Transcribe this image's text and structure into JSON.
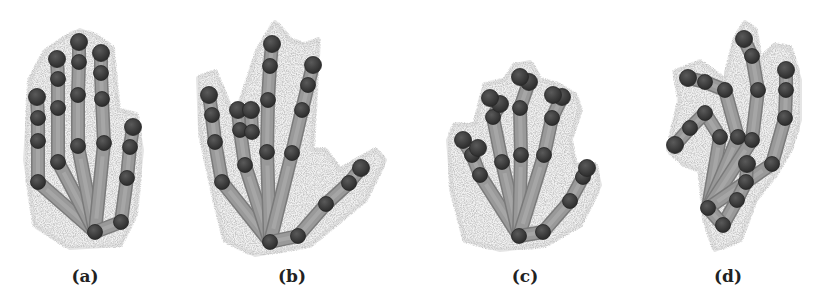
{
  "figure": {
    "background": "#ffffff",
    "colors": {
      "point_cloud": "#bdbdbd",
      "bone": "#999999",
      "bone_edge": "#7a7a7a",
      "joint": "#3c3c3c",
      "joint_band": "#585858"
    },
    "panels": [
      {
        "id": "a",
        "label": "(a)",
        "label_x": 85,
        "cloud": [
          [
            30,
            80
          ],
          [
            45,
            52
          ],
          [
            65,
            38
          ],
          [
            80,
            30
          ],
          [
            96,
            36
          ],
          [
            112,
            48
          ],
          [
            118,
            110
          ],
          [
            136,
            115
          ],
          [
            142,
            150
          ],
          [
            135,
            215
          ],
          [
            120,
            245
          ],
          [
            70,
            248
          ],
          [
            35,
            225
          ],
          [
            25,
            160
          ]
        ],
        "roots": [
          [
            95,
            232
          ],
          [
            121,
            222
          ]
        ],
        "fingers": [
          {
            "name": "pinky",
            "root": 0,
            "joints": [
              [
                38,
                182
              ],
              [
                38,
                141
              ],
              [
                38,
                118
              ],
              [
                37,
                97
              ]
            ]
          },
          {
            "name": "ring",
            "root": 0,
            "joints": [
              [
                58,
                162
              ],
              [
                58,
                108
              ],
              [
                58,
                79
              ],
              [
                57,
                59
              ]
            ]
          },
          {
            "name": "middle",
            "root": 0,
            "joints": [
              [
                78,
                146
              ],
              [
                78,
                95
              ],
              [
                79,
                62
              ],
              [
                79,
                42
              ]
            ]
          },
          {
            "name": "index",
            "root": 0,
            "joints": [
              [
                104,
                143
              ],
              [
                102,
                99
              ],
              [
                101,
                73
              ],
              [
                101,
                53
              ]
            ]
          },
          {
            "name": "thumb",
            "root": 1,
            "joints": [
              [
                127,
                178
              ],
              [
                130,
                147
              ],
              [
                133,
                127
              ]
            ]
          }
        ],
        "palm_link": [
          [
            95,
            232
          ],
          [
            121,
            222
          ]
        ]
      },
      {
        "id": "b",
        "label": "(b)",
        "label_x": 292,
        "cloud": [
          [
            198,
            78
          ],
          [
            215,
            72
          ],
          [
            235,
            120
          ],
          [
            258,
            50
          ],
          [
            275,
            22
          ],
          [
            290,
            40
          ],
          [
            305,
            45
          ],
          [
            318,
            40
          ],
          [
            312,
            150
          ],
          [
            325,
            150
          ],
          [
            340,
            170
          ],
          [
            375,
            150
          ],
          [
            385,
            160
          ],
          [
            365,
            200
          ],
          [
            310,
            245
          ],
          [
            255,
            255
          ],
          [
            225,
            240
          ],
          [
            215,
            200
          ],
          [
            200,
            130
          ]
        ],
        "roots": [
          [
            270,
            242
          ],
          [
            298,
            236
          ]
        ],
        "fingers": [
          {
            "name": "pinky",
            "root": 0,
            "joints": [
              [
                222,
                182
              ],
              [
                215,
                142
              ],
              [
                212,
                115
              ],
              [
                209,
                95
              ]
            ]
          },
          {
            "name": "ring",
            "root": 0,
            "joints": [
              [
                245,
                165
              ],
              [
                240,
                130
              ],
              [
                238,
                110
              ]
            ]
          },
          {
            "name": "ring-tip-offset",
            "root": null,
            "joints": [
              [
                252,
                132
              ],
              [
                251,
                110
              ]
            ]
          },
          {
            "name": "middle",
            "root": 0,
            "joints": [
              [
                267,
                152
              ],
              [
                268,
                100
              ],
              [
                270,
                66
              ],
              [
                272,
                44
              ]
            ]
          },
          {
            "name": "index",
            "root": 0,
            "joints": [
              [
                292,
                153
              ],
              [
                302,
                110
              ],
              [
                308,
                85
              ],
              [
                313,
                65
              ]
            ]
          },
          {
            "name": "thumb",
            "root": 1,
            "joints": [
              [
                326,
                204
              ],
              [
                349,
                183
              ],
              [
                361,
                168
              ]
            ]
          }
        ],
        "palm_link": [
          [
            270,
            242
          ],
          [
            298,
            236
          ]
        ]
      },
      {
        "id": "c",
        "label": "(c)",
        "label_x": 525,
        "cloud": [
          [
            455,
            125
          ],
          [
            475,
            125
          ],
          [
            485,
            85
          ],
          [
            505,
            80
          ],
          [
            515,
            65
          ],
          [
            530,
            62
          ],
          [
            540,
            80
          ],
          [
            558,
            85
          ],
          [
            575,
            95
          ],
          [
            580,
            110
          ],
          [
            570,
            140
          ],
          [
            575,
            165
          ],
          [
            595,
            165
          ],
          [
            600,
            185
          ],
          [
            580,
            225
          ],
          [
            545,
            245
          ],
          [
            500,
            250
          ],
          [
            465,
            240
          ],
          [
            452,
            190
          ],
          [
            448,
            140
          ]
        ],
        "roots": [
          [
            519,
            236
          ],
          [
            543,
            232
          ]
        ],
        "fingers": [
          {
            "name": "pinky",
            "root": 0,
            "joints": [
              [
                480,
                175
              ],
              [
                472,
                155
              ],
              [
                463,
                140
              ]
            ]
          },
          {
            "name": "pinky-tip-offset",
            "root": null,
            "joints": [
              [
                478,
                148
              ]
            ]
          },
          {
            "name": "ring",
            "root": 0,
            "joints": [
              [
                502,
                162
              ],
              [
                493,
                117
              ],
              [
                500,
                104
              ]
            ]
          },
          {
            "name": "ring-tip-offset",
            "root": null,
            "joints": [
              [
                490,
                98
              ]
            ]
          },
          {
            "name": "middle",
            "root": 0,
            "joints": [
              [
                521,
                155
              ],
              [
                520,
                108
              ],
              [
                529,
                82
              ]
            ]
          },
          {
            "name": "middle-tip-offset",
            "root": null,
            "joints": [
              [
                520,
                77
              ]
            ]
          },
          {
            "name": "index",
            "root": 0,
            "joints": [
              [
                544,
                155
              ],
              [
                552,
                118
              ],
              [
                562,
                97
              ]
            ]
          },
          {
            "name": "index-tip-offset",
            "root": null,
            "joints": [
              [
                553,
                95
              ]
            ]
          },
          {
            "name": "thumb",
            "root": 1,
            "joints": [
              [
                570,
                201
              ],
              [
                583,
                177
              ],
              [
                587,
                168
              ]
            ]
          }
        ],
        "palm_link": [
          [
            519,
            236
          ],
          [
            543,
            232
          ]
        ]
      },
      {
        "id": "d",
        "label": "(d)",
        "label_x": 728,
        "cloud": [
          [
            668,
            150
          ],
          [
            680,
            100
          ],
          [
            675,
            72
          ],
          [
            700,
            62
          ],
          [
            725,
            80
          ],
          [
            735,
            40
          ],
          [
            745,
            22
          ],
          [
            755,
            30
          ],
          [
            760,
            60
          ],
          [
            775,
            45
          ],
          [
            790,
            48
          ],
          [
            800,
            80
          ],
          [
            800,
            120
          ],
          [
            790,
            150
          ],
          [
            775,
            175
          ],
          [
            755,
            200
          ],
          [
            740,
            240
          ],
          [
            715,
            250
          ],
          [
            705,
            220
          ],
          [
            700,
            170
          ],
          [
            685,
            165
          ]
        ],
        "roots": [
          [
            708,
            208
          ],
          [
            723,
            225
          ]
        ],
        "fingers": [
          {
            "name": "finger-low-left",
            "root": 0,
            "joints": [
              [
                720,
                137
              ],
              [
                705,
                113
              ],
              [
                690,
                128
              ],
              [
                675,
                145
              ]
            ]
          },
          {
            "name": "finger-high-left",
            "root": 0,
            "joints": [
              [
                738,
                137
              ],
              [
                725,
                90
              ],
              [
                705,
                82
              ],
              [
                688,
                78
              ]
            ]
          },
          {
            "name": "middle",
            "root": 0,
            "joints": [
              [
                752,
                140
              ],
              [
                758,
                90
              ],
              [
                752,
                56
              ],
              [
                744,
                39
              ]
            ]
          },
          {
            "name": "index",
            "root": 0,
            "joints": [
              [
                772,
                164
              ],
              [
                785,
                118
              ],
              [
                786,
                90
              ],
              [
                786,
                70
              ]
            ]
          },
          {
            "name": "thumb",
            "root": 1,
            "joints": [
              [
                737,
                200
              ],
              [
                746,
                182
              ],
              [
                747,
                164
              ]
            ]
          }
        ],
        "palm_link": [
          [
            708,
            208
          ],
          [
            723,
            225
          ]
        ]
      }
    ]
  }
}
